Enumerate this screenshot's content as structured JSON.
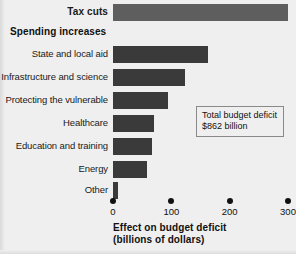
{
  "chart_data": {
    "type": "bar",
    "orientation": "horizontal",
    "title": "",
    "xlabel": "Effect on budget deficit\n(billions of dollars)",
    "xlabel_line1": "Effect on budget deficit",
    "xlabel_line2": "(billions of dollars)",
    "ylabel": "",
    "xlim": [
      0,
      300
    ],
    "xticks": [
      0,
      100,
      200,
      300
    ],
    "xtick_labels": [
      "0",
      "100",
      "200",
      "300"
    ],
    "grid": false,
    "legend": "none",
    "units": "billions of dollars",
    "categories": [
      "Tax cuts",
      "State and local aid",
      "Infrastructure and science",
      "Protecting the vulnerable",
      "Healthcare",
      "Education and training",
      "Energy",
      "Other"
    ],
    "values": [
      300,
      163,
      123,
      95,
      70,
      67,
      58,
      8
    ],
    "bar_colors": [
      "#5e5e5e",
      "#3a3a3a",
      "#3a3a3a",
      "#3a3a3a",
      "#3a3a3a",
      "#3a3a3a",
      "#3a3a3a",
      "#3a3a3a"
    ],
    "annotations": [
      {
        "line1": "Total budget deficit",
        "line2": "$862 billion"
      }
    ],
    "section_headers": [
      {
        "label": "Spending increases",
        "before_category": "State and local aid"
      }
    ]
  },
  "rows": [
    {
      "label": "Tax cuts",
      "value": 300,
      "bold": true,
      "light": true,
      "top": 2
    },
    {
      "label": "State and local aid",
      "value": 163,
      "bold": false,
      "light": false,
      "top": 44
    },
    {
      "label": "Infrastructure and science",
      "value": 123,
      "bold": false,
      "light": false,
      "top": 67
    },
    {
      "label": "Protecting the vulnerable",
      "value": 95,
      "bold": false,
      "light": false,
      "top": 90
    },
    {
      "label": "Healthcare",
      "value": 70,
      "bold": false,
      "light": false,
      "top": 113
    },
    {
      "label": "Education and training",
      "value": 67,
      "bold": false,
      "light": false,
      "top": 136
    },
    {
      "label": "Energy",
      "value": 58,
      "bold": false,
      "light": false,
      "top": 159
    },
    {
      "label": "Other",
      "value": 8,
      "bold": false,
      "light": false,
      "top": 180
    }
  ],
  "section_header": {
    "label": "Spending increases",
    "top": 22
  },
  "axis": {
    "ticks": [
      {
        "label": "0",
        "value": 0
      },
      {
        "label": "100",
        "value": 100
      },
      {
        "label": "200",
        "value": 200
      },
      {
        "label": "300",
        "value": 300
      }
    ],
    "title_line1": "Effect on budget deficit",
    "title_line2": "(billions of dollars)"
  },
  "annotation": {
    "line1": "Total budget deficit",
    "line2": "$862 billion"
  },
  "colors": {
    "background": "#efefef",
    "bar_dark": "#3a3a3a",
    "bar_light": "#5e5e5e",
    "text": "#111111",
    "annotation_border": "#8a8a8a"
  }
}
